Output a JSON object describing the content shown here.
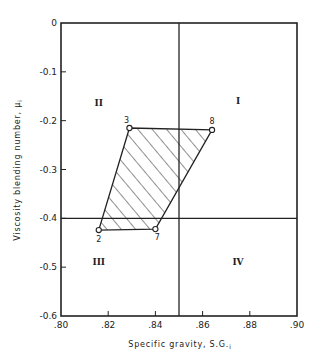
{
  "chart_data": {
    "type": "scatter",
    "title": "",
    "xlabel": "Specific gravity, S.G.ᵢ",
    "ylabel": "Viscosity blending number, μᵢ",
    "xlim": [
      0.8,
      0.9
    ],
    "ylim": [
      -0.6,
      0.0
    ],
    "xticks": [
      ".80",
      ".82",
      ".84",
      ".86",
      ".88",
      ".90"
    ],
    "yticks": [
      "0",
      "-0.1",
      "-0.2",
      "-0.3",
      "-0.4",
      "-0.5",
      "-0.6"
    ],
    "xtick_values": [
      0.8,
      0.82,
      0.84,
      0.86,
      0.88,
      0.9
    ],
    "ytick_values": [
      0,
      -0.1,
      -0.2,
      -0.3,
      -0.4,
      -0.5,
      -0.6
    ],
    "grid": false,
    "reference_lines": {
      "vertical_x": 0.85,
      "horizontal_y": -0.4
    },
    "points": [
      {
        "label": "3",
        "x": 0.829,
        "y": -0.215
      },
      {
        "label": "8",
        "x": 0.864,
        "y": -0.219
      },
      {
        "label": "7",
        "x": 0.84,
        "y": -0.422
      },
      {
        "label": "2",
        "x": 0.816,
        "y": -0.424
      }
    ],
    "shaded_region": {
      "vertices": [
        "3",
        "8",
        "7",
        "2"
      ],
      "fill": "diagonal-hatch"
    },
    "region_labels": [
      {
        "label": "I",
        "x": 0.875,
        "y": -0.165
      },
      {
        "label": "II",
        "x": 0.816,
        "y": -0.17
      },
      {
        "label": "III",
        "x": 0.816,
        "y": -0.495
      },
      {
        "label": "IV",
        "x": 0.875,
        "y": -0.495
      }
    ]
  },
  "axes": {
    "xlabel_main": "Specific gravity, S.G.",
    "xlabel_sub": "i",
    "ylabel_main": "Viscosity blending number, μ",
    "ylabel_sub": "i"
  },
  "colors": {
    "ink": "#222222",
    "background": "#ffffff"
  }
}
